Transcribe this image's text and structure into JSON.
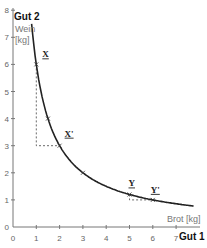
{
  "chart_data": {
    "type": "line",
    "title": "",
    "xlabel": "Brot [kg]",
    "xlabel_axis": "Gut 1",
    "ylabel_axis": "Gut 2",
    "ylabel_name": "Wein",
    "ylabel_unit": "[kg]",
    "xlim": [
      0,
      7.5
    ],
    "ylim": [
      0,
      8
    ],
    "x_ticks": [
      "0",
      "1",
      "2",
      "3",
      "4",
      "5",
      "6",
      "7"
    ],
    "y_ticks": [
      "0",
      "1",
      "2",
      "3",
      "4",
      "5",
      "6",
      "7",
      "8"
    ],
    "grid": false,
    "legend": null,
    "series": [
      {
        "name": "Indifferenzkurve",
        "function": "y = 6/x",
        "x": [
          0.8,
          1,
          1.5,
          2,
          3,
          4,
          5,
          6,
          7,
          7.5
        ],
        "values": [
          7.5,
          6,
          4,
          3,
          2,
          1.5,
          1.2,
          1,
          0.857,
          0.8
        ]
      }
    ],
    "points": [
      {
        "label": "X",
        "x": 1,
        "y": 6
      },
      {
        "label": "X'",
        "x": 2,
        "y": 3
      },
      {
        "label": "Y",
        "x": 5,
        "y": 1.2
      },
      {
        "label": "Y'",
        "x": 6,
        "y": 1
      }
    ],
    "markers": [
      {
        "x": 1.5,
        "y": 4
      },
      {
        "x": 3,
        "y": 2
      }
    ],
    "annotations": [
      {
        "type": "dashed-step",
        "from": [
          1,
          6
        ],
        "corner": [
          1,
          3
        ],
        "to": [
          2,
          3
        ]
      },
      {
        "type": "dashed-step",
        "from": [
          5,
          1.2
        ],
        "corner": [
          5,
          1
        ],
        "to": [
          6,
          1
        ]
      }
    ]
  },
  "labels": {
    "gut2": "Gut 2",
    "wein": "Wein",
    "kg_y": "[kg]",
    "brot": "Brot [kg]",
    "gut1": "Gut 1",
    "x": "X",
    "x_prime": "X'",
    "y": "Y",
    "y_prime": "Y'"
  }
}
